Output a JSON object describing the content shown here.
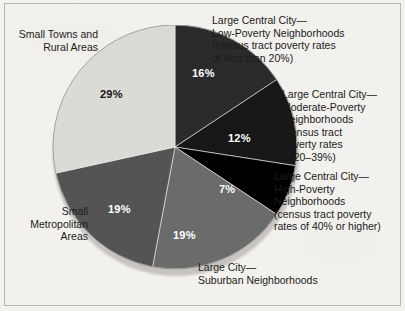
{
  "figure": {
    "background_color": "#f3f1ed",
    "border_color": "#b9b6b0"
  },
  "chart_data": {
    "type": "pie",
    "title": "",
    "subtitle": "",
    "xlabel": "",
    "ylabel": "",
    "legend_position": "callout-labels",
    "units": "percent",
    "total": 102,
    "start_angle_deg": 0,
    "direction": "clockwise",
    "categories": [
      "Large Central City—Low-Poverty Neighborhoods (census tract poverty rates of less than 20%)",
      "Large Central City—Moderate-Poverty Neighborhoods (census tract poverty rates of 20–39%)",
      "Large Central City—High-Poverty Neighborhoods (census tract poverty rates of 40% or higher)",
      "Large City—Suburban Neighborhoods",
      "Small Metropolitan Areas",
      "Small Towns and Rural Areas"
    ],
    "values": [
      16,
      12,
      7,
      19,
      19,
      29
    ],
    "value_labels": [
      "16%",
      "12%",
      "7%",
      "19%",
      "19%",
      "29%"
    ],
    "colors": [
      "#2b2b2b",
      "#171717",
      "#000000",
      "#6b6b6b",
      "#545454",
      "#dcdad6"
    ],
    "label_text_colors": [
      "#ffffff",
      "#ffffff",
      "#ffffff",
      "#ffffff",
      "#ffffff",
      "#141414"
    ]
  },
  "slice_values": {
    "low_poverty": "16%",
    "moderate_poverty": "12%",
    "high_poverty": "7%",
    "suburban": "19%",
    "small_metro": "19%",
    "small_towns": "29%"
  },
  "callouts": {
    "low_poverty": "Large Central City—\nLow-Poverty Neighborhoods\n(census tract poverty rates\nof less than 20%)",
    "moderate_poverty": "Large Central City—\nModerate-Poverty\nNeighborhoods\n(census tract\npoverty rates\nof 20–39%)",
    "high_poverty": "Large Central City—\nHigh-Poverty\nNeighborhoods\n(census tract poverty\nrates of 40% or higher)",
    "suburban": "Large City—\nSuburban Neighborhoods",
    "small_metro": "Small\nMetropolitan\nAreas",
    "small_towns": "Small Towns and\nRural Areas"
  }
}
